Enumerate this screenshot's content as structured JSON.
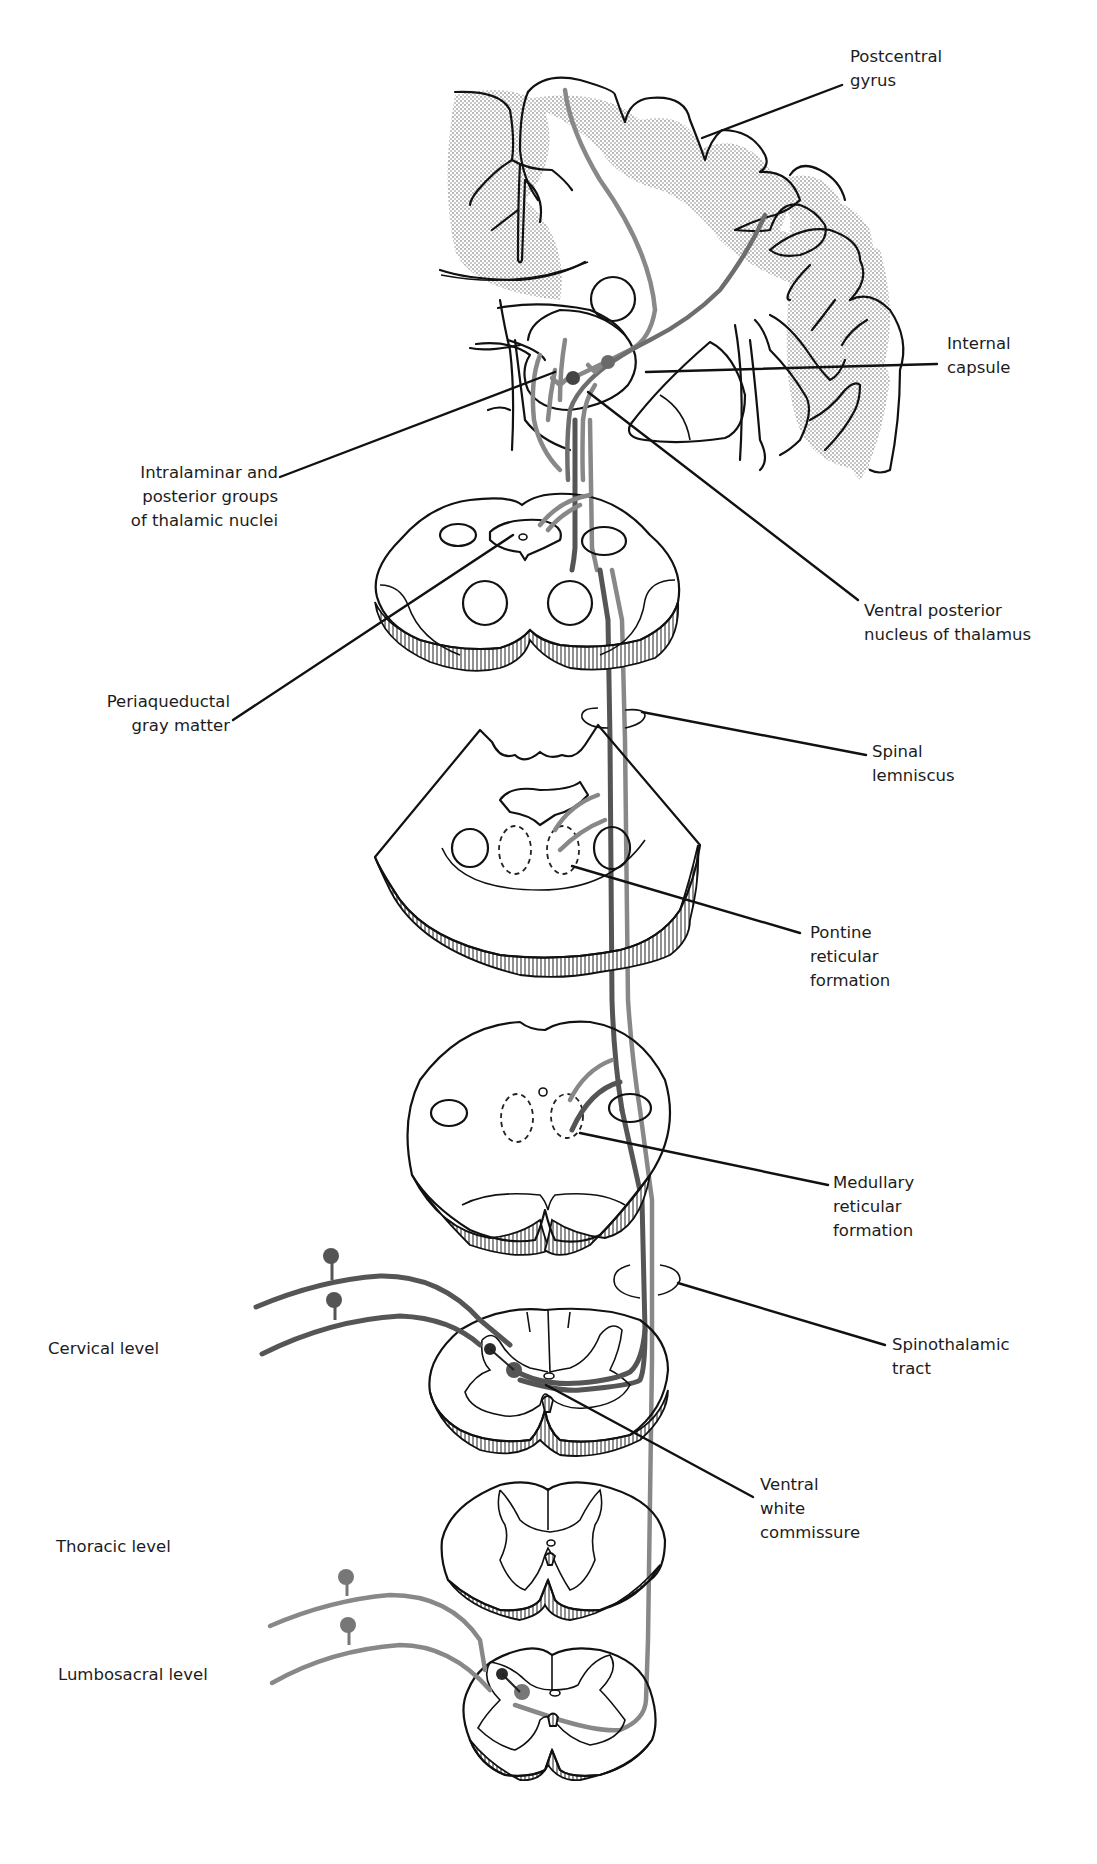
{
  "figure": {
    "colors": {
      "background": "#ffffff",
      "outline": "#111111",
      "tract_dark": "#555555",
      "tract_mid": "#6e6e6e",
      "tract_light": "#888888",
      "neuron_dark": "#2a2a2a",
      "neuron_gray": "#666666",
      "cortex_shading": "#cfcfcf"
    }
  },
  "labels": {
    "postcentral_gyrus": "Postcentral\ngyrus",
    "internal_capsule": "Internal\ncapsule",
    "intralaminar": "Intralaminar and\nposterior groups\nof thalamic nuclei",
    "ventral_posterior": "Ventral posterior\nnucleus of thalamus",
    "periaqueductal": "Periaqueductal\ngray matter",
    "spinal_lemniscus": "Spinal\nlemniscus",
    "pontine_rf": "Pontine\nreticular\nformation",
    "medullary_rf": "Medullary\nreticular\nformation",
    "spinothalamic_tract": "Spinothalamic\ntract",
    "ventral_white_commissure": "Ventral\nwhite\ncommissure",
    "cervical_level": "Cervical level",
    "thoracic_level": "Thoracic level",
    "lumbosacral_level": "Lumbosacral level"
  },
  "sections": [
    {
      "id": "cerebrum",
      "name": "Coronal section of cerebral hemisphere with thalamus"
    },
    {
      "id": "midbrain",
      "name": "Midbrain cross-section"
    },
    {
      "id": "pons",
      "name": "Pons cross-section"
    },
    {
      "id": "medulla",
      "name": "Medulla cross-section"
    },
    {
      "id": "cervical",
      "name": "Cervical spinal cord section"
    },
    {
      "id": "thoracic",
      "name": "Thoracic spinal cord section"
    },
    {
      "id": "lumbosacral",
      "name": "Lumbosacral spinal cord section"
    }
  ]
}
